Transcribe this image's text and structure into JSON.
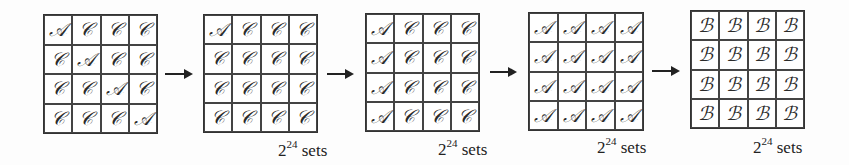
{
  "diagram": {
    "stages": [
      {
        "id": "stage-1",
        "cells": [
          [
            "𝒜",
            "𝒞",
            "𝒞",
            "𝒞"
          ],
          [
            "𝒞",
            "𝒜",
            "𝒞",
            "𝒞"
          ],
          [
            "𝒞",
            "𝒞",
            "𝒜",
            "𝒞"
          ],
          [
            "𝒞",
            "𝒞",
            "𝒞",
            "𝒜"
          ]
        ],
        "label": null
      },
      {
        "id": "stage-2",
        "cells": [
          [
            "𝒜",
            "𝒞",
            "𝒞",
            "𝒞"
          ],
          [
            "𝒞",
            "𝒞",
            "𝒞",
            "𝒞"
          ],
          [
            "𝒞",
            "𝒞",
            "𝒞",
            "𝒞"
          ],
          [
            "𝒞",
            "𝒞",
            "𝒞",
            "𝒞"
          ]
        ],
        "label": {
          "base": "2",
          "exp": "24",
          "suffix": " sets"
        }
      },
      {
        "id": "stage-3",
        "cells": [
          [
            "𝒜",
            "𝒞",
            "𝒞",
            "𝒞"
          ],
          [
            "𝒜",
            "𝒞",
            "𝒞",
            "𝒞"
          ],
          [
            "𝒜",
            "𝒞",
            "𝒞",
            "𝒞"
          ],
          [
            "𝒜",
            "𝒞",
            "𝒞",
            "𝒞"
          ]
        ],
        "label": {
          "base": "2",
          "exp": "24",
          "suffix": " sets"
        }
      },
      {
        "id": "stage-4",
        "cells": [
          [
            "𝒜",
            "𝒜",
            "𝒜",
            "𝒜"
          ],
          [
            "𝒜",
            "𝒜",
            "𝒜",
            "𝒜"
          ],
          [
            "𝒜",
            "𝒜",
            "𝒜",
            "𝒜"
          ],
          [
            "𝒜",
            "𝒜",
            "𝒜",
            "𝒜"
          ]
        ],
        "label": {
          "base": "2",
          "exp": "24",
          "suffix": " sets"
        }
      },
      {
        "id": "stage-5",
        "cells": [
          [
            "ℬ",
            "ℬ",
            "ℬ",
            "ℬ"
          ],
          [
            "ℬ",
            "ℬ",
            "ℬ",
            "ℬ"
          ],
          [
            "ℬ",
            "ℬ",
            "ℬ",
            "ℬ"
          ],
          [
            "ℬ",
            "ℬ",
            "ℬ",
            "ℬ"
          ]
        ],
        "label": {
          "base": "2",
          "exp": "24",
          "suffix": " sets"
        }
      }
    ],
    "arrows": 4
  }
}
